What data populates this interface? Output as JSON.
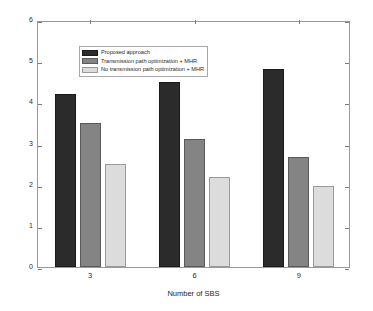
{
  "chart_data": {
    "type": "bar",
    "title": "",
    "subtitle": "",
    "xlabel": "Number of SBS",
    "ylabel": "QoE",
    "categories": [
      "3",
      "6",
      "9"
    ],
    "series": [
      {
        "name": "Proposed approach",
        "color": "#2b2b2b",
        "values": [
          4.2,
          4.5,
          4.8
        ]
      },
      {
        "name": "Transmission path optimization + MHR",
        "color": "#848484",
        "values": [
          3.5,
          3.1,
          2.68
        ]
      },
      {
        "name": "No transmission path optimization + MHR",
        "color": "#dcdcdc",
        "values": [
          2.5,
          2.18,
          1.98
        ]
      }
    ],
    "ylim": [
      0,
      6
    ],
    "yticks": [
      "0",
      "1",
      "2",
      "3",
      "4",
      "5",
      "6"
    ],
    "xticks": [
      "3",
      "6",
      "9"
    ],
    "grid": false,
    "legend_position": "upper-left",
    "annotations": []
  },
  "legend": {
    "entries": [
      {
        "label": "Proposed approach"
      },
      {
        "label": "Transmission path optimization + MHR"
      },
      {
        "label": "No transmission path optimization + MHR"
      }
    ]
  },
  "axes": {
    "y_label": "QoE",
    "x_label": "Number of SBS"
  }
}
